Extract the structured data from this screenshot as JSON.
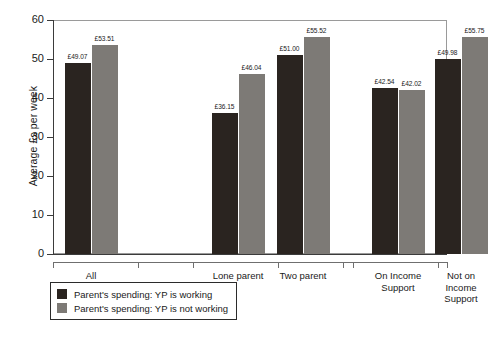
{
  "chart_data": {
    "type": "bar",
    "title": "",
    "xlabel": "",
    "ylabel": "Average £s per week",
    "ylim": [
      0,
      60
    ],
    "yticks": [
      0,
      10,
      20,
      30,
      40,
      50,
      60
    ],
    "grid": false,
    "legend_position": "bottom-left",
    "categories": [
      "All",
      "Lone parent",
      "Two parent",
      "On Income Support",
      "Not on Income Support"
    ],
    "category_label_lines": [
      [
        "All"
      ],
      [
        "Lone parent"
      ],
      [
        "Two parent"
      ],
      [
        "On Income",
        "Support"
      ],
      [
        "Not on",
        "Income",
        "Support"
      ]
    ],
    "series": [
      {
        "name": "Parent's spending: YP is working",
        "color": "#2a2420",
        "values": [
          49.07,
          36.15,
          51.0,
          42.54,
          49.98
        ],
        "labels": [
          "£49.07",
          "£36.15",
          "£51.00",
          "£42.54",
          "£49.98"
        ]
      },
      {
        "name": "Parent's spending: YP is not working",
        "color": "#7d7a76",
        "values": [
          53.51,
          46.04,
          55.52,
          42.02,
          55.75
        ],
        "labels": [
          "£53.51",
          "£46.04",
          "£55.52",
          "£42.02",
          "£55.75"
        ]
      }
    ]
  },
  "legend": {
    "items": [
      {
        "label": "Parent's spending: YP is working",
        "color": "#2a2420"
      },
      {
        "label": "Parent's spending: YP is not working",
        "color": "#7d7a76"
      }
    ]
  },
  "axis": {
    "y_title": "Average £s per week",
    "y_tick_labels": [
      "60",
      "50",
      "40",
      "30",
      "20",
      "10",
      "0"
    ]
  }
}
